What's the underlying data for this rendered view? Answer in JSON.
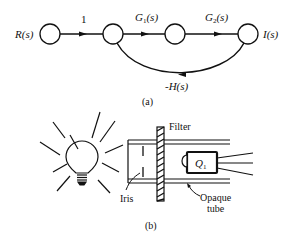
{
  "figure_a": {
    "caption": "(a)",
    "input_label": "R(s)",
    "output_label": "I(s)",
    "branches": [
      {
        "from": "node1",
        "to": "node2",
        "gain": "1"
      },
      {
        "from": "node2",
        "to": "node3",
        "gain": "G1(s)",
        "gain_main": "G",
        "gain_sub": "1",
        "gain_arg": "(s)"
      },
      {
        "from": "node3",
        "to": "node4",
        "gain": "G2(s)",
        "gain_main": "G",
        "gain_sub": "2",
        "gain_arg": "(s)"
      },
      {
        "from": "node4",
        "to": "node2",
        "gain": "-H(s)"
      }
    ]
  },
  "figure_b": {
    "caption": "(b)",
    "labels": {
      "filter": "Filter",
      "iris": "Iris",
      "opaque_line1": "Opaque",
      "opaque_line2": "tube",
      "q_main": "Q",
      "q_sub": "1"
    }
  },
  "colors": {
    "ink": "#111111",
    "background": "#ffffff"
  }
}
